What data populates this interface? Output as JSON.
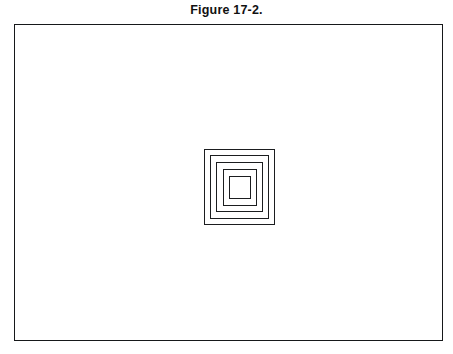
{
  "figure": {
    "caption": "Figure 17-2.",
    "frame": {
      "x": 14,
      "y": 24,
      "width": 429,
      "height": 317,
      "border_color": "#16181a",
      "border_width": 1.6,
      "background": "#ffffff"
    },
    "illustration": {
      "name": "concentric-nested-rectangles",
      "description": "Five concentric hollow rectangles nested inside one another, centered in the frame",
      "ring_count": 5,
      "center": {
        "x": 224,
        "y": 162
      },
      "stroke_color": "#1b1d1f",
      "stroke_width": 1.5,
      "fill": "none",
      "innermost_fill": "#ffffff",
      "rings": [
        {
          "index": 1,
          "label": "ring-outermost",
          "x": 0,
          "y": 0,
          "width": 71,
          "height": 76
        },
        {
          "index": 2,
          "label": "ring-2",
          "x": 6,
          "y": 6,
          "width": 59,
          "height": 64
        },
        {
          "index": 3,
          "label": "ring-3",
          "x": 12,
          "y": 13,
          "width": 47,
          "height": 50
        },
        {
          "index": 4,
          "label": "ring-4",
          "x": 19,
          "y": 20,
          "width": 34,
          "height": 37
        },
        {
          "index": 5,
          "label": "ring-innermost",
          "x": 25,
          "y": 27,
          "width": 22,
          "height": 23
        }
      ]
    }
  },
  "page": {
    "background": "#ffffff",
    "width": 453,
    "height": 354
  }
}
